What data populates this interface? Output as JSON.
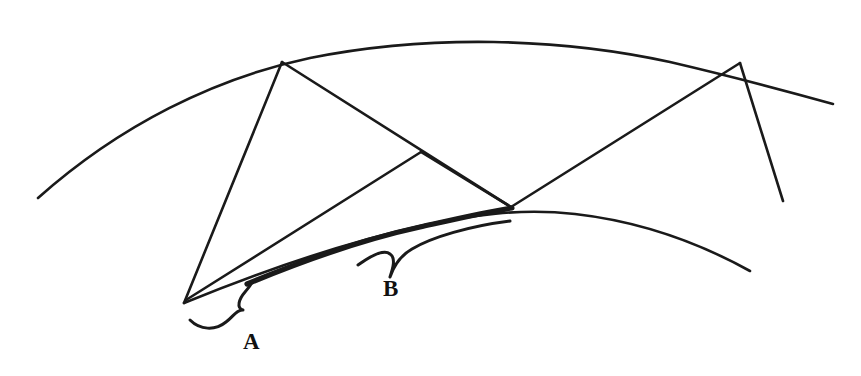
{
  "figure": {
    "background_color": "#ffffff",
    "ink_color": "#1a1a1a",
    "width": 861,
    "height": 376
  },
  "labels": [
    {
      "id": "label-a",
      "text": "A",
      "x": 243,
      "y": 349,
      "font_size": 23,
      "description": "Label for the short brace segment on the lower-left of the inner arc"
    },
    {
      "id": "label-b",
      "text": "B",
      "x": 383,
      "y": 296,
      "font_size": 23,
      "description": "Label for the long brace segment along the inner arc"
    }
  ],
  "curves": {
    "outer_arc": {
      "name": "outer-arc",
      "stroke_width": 2.6,
      "path": "M 38 198 C 120 125, 215 78, 310 58 C 430 34, 560 38, 670 62 C 730 76, 790 92, 833 104"
    },
    "inner_arc": {
      "name": "inner-arc",
      "stroke_width": 2.6,
      "path": "M 184 303 C 250 276, 330 246, 420 226 C 470 215, 520 208, 575 214 C 645 222, 705 246, 750 271"
    },
    "thick_inner_arc": {
      "name": "thick-inner-arc-highlight",
      "stroke_width": 5.2,
      "path": "M 247 284 C 300 262, 360 240, 420 227 C 460 218, 490 211, 512 208"
    }
  },
  "segments": [
    {
      "name": "chord-left-up",
      "stroke_width": 2.6,
      "x1": 184,
      "y1": 303,
      "x2": 282,
      "y2": 62
    },
    {
      "name": "chord-top-left-to-lower-vertex",
      "stroke_width": 2.6,
      "x1": 282,
      "y1": 62,
      "x2": 511,
      "y2": 207
    },
    {
      "name": "chord-lower-left-to-mid-vertex",
      "stroke_width": 2.6,
      "x1": 186,
      "y1": 300,
      "x2": 421,
      "y2": 152
    },
    {
      "name": "chord-mid-vertex-to-lower-vertex",
      "stroke_width": 2.6,
      "x1": 421,
      "y1": 152,
      "x2": 511,
      "y2": 207
    },
    {
      "name": "chord-lower-vertex-to-top-right",
      "stroke_width": 2.6,
      "x1": 511,
      "y1": 207,
      "x2": 740,
      "y2": 63
    },
    {
      "name": "ray-top-right-down",
      "stroke_width": 2.6,
      "x1": 740,
      "y1": 63,
      "x2": 783,
      "y2": 201
    }
  ],
  "braces": [
    {
      "name": "brace-a",
      "stroke_width": 3.0,
      "path": "M 190 320 C 200 330, 215 331, 226 322 C 234 316, 236 310, 243 310 C 236 308, 239 299, 245 292 C 249 287, 251 285, 252 282"
    },
    {
      "name": "brace-b",
      "stroke_width": 3.0,
      "path": "M 358 265 C 372 255, 384 249, 390 254 C 396 258, 393 268, 390 277 C 393 268, 400 256, 412 249 C 432 237, 470 226, 510 221"
    }
  ],
  "vertices": [
    {
      "name": "vertex-top-left",
      "x": 282,
      "y": 62
    },
    {
      "name": "vertex-top-right",
      "x": 740,
      "y": 63
    },
    {
      "name": "vertex-lower-left",
      "x": 184,
      "y": 303
    },
    {
      "name": "vertex-mid",
      "x": 421,
      "y": 152
    },
    {
      "name": "vertex-lower-center",
      "x": 511,
      "y": 207
    }
  ]
}
